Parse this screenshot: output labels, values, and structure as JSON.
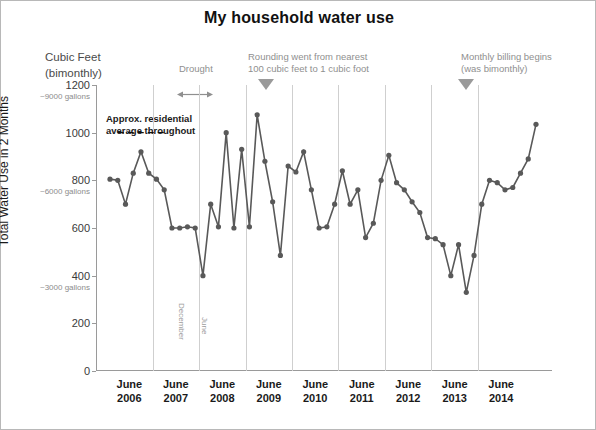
{
  "title": "My household water use",
  "unit_label_line1": "Cubic Feet",
  "unit_label_line2": "(bimonthly)",
  "annotations": {
    "drought": "Drought",
    "rounding_line1": "Rounding went from nearest",
    "rounding_line2": "100 cubic feet to 1 cubic foot",
    "billing_line1": "Monthly billing begins",
    "billing_line2": "(was bimonthly)",
    "average_line1": "Approx. residential",
    "average_line2": "average throughout",
    "december": "December",
    "june": "June"
  },
  "chart_data": {
    "type": "line",
    "title": "My household water use",
    "xlabel": "",
    "ylabel": "Total Water Use in 2 Months",
    "ylim": [
      0,
      1200
    ],
    "yticks": [
      0,
      200,
      400,
      600,
      800,
      1000,
      1200
    ],
    "ytick_labels": [
      "0",
      "200",
      "400",
      "600",
      "800",
      "1000",
      "1200"
    ],
    "gallon_labels": [
      {
        "value": 1200,
        "label": "~9000 gallons"
      },
      {
        "value": 800,
        "label": "~6000 gallons"
      },
      {
        "value": 400,
        "label": "~3000 gallons"
      }
    ],
    "grid": false,
    "legend": "none",
    "marker": "circle",
    "color": "#595959",
    "xtick_groups": [
      {
        "month": "June",
        "year": "2006"
      },
      {
        "month": "June",
        "year": "2007"
      },
      {
        "month": "June",
        "year": "2008"
      },
      {
        "month": "June",
        "year": "2009"
      },
      {
        "month": "June",
        "year": "2010"
      },
      {
        "month": "June",
        "year": "2011"
      },
      {
        "month": "June",
        "year": "2012"
      },
      {
        "month": "June",
        "year": "2013"
      },
      {
        "month": "June",
        "year": "2014"
      }
    ],
    "average_line": {
      "value": 1000,
      "style": "dashed",
      "from_index": 1,
      "to_index": 7
    },
    "values": [
      805,
      800,
      700,
      830,
      920,
      830,
      805,
      760,
      600,
      600,
      605,
      600,
      400,
      700,
      605,
      1000,
      600,
      930,
      605,
      1075,
      880,
      710,
      485,
      860,
      835,
      920,
      760,
      600,
      605,
      700,
      840,
      700,
      760,
      560,
      620,
      800,
      905,
      790,
      760,
      710,
      665,
      560,
      555,
      530,
      400,
      530,
      330,
      485,
      700,
      800,
      790,
      760,
      770,
      830,
      890,
      1035
    ]
  }
}
